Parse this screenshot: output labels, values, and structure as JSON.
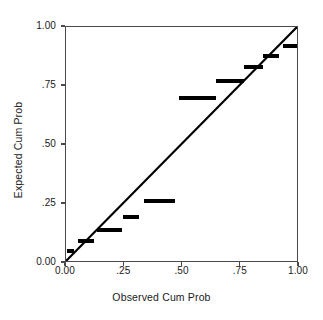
{
  "chart_data": {
    "type": "scatter",
    "title": "",
    "xlabel": "Observed Cum Prob",
    "ylabel": "Expected Cum Prob",
    "xlim": [
      0.0,
      1.0
    ],
    "ylim": [
      0.0,
      1.0
    ],
    "grid": false,
    "legend": null,
    "xticks": [
      0.0,
      0.25,
      0.5,
      0.75,
      1.0
    ],
    "yticks": [
      0.0,
      0.25,
      0.5,
      0.75,
      1.0
    ],
    "xticklabels": [
      "0.00",
      ".25",
      ".50",
      ".75",
      "1.00"
    ],
    "yticklabels": [
      "0.00",
      ".25",
      ".50",
      ".75",
      "1.00"
    ],
    "reference_line": {
      "description": "diagonal identity line",
      "x": [
        0.0,
        1.0
      ],
      "y": [
        0.0,
        1.0
      ],
      "color": "#000000"
    },
    "marker": {
      "shape": "square",
      "color": "#000000",
      "size_px": 4
    },
    "series": [
      {
        "name": "Normal P-P",
        "x": [
          0.011,
          0.026,
          0.06,
          0.073,
          0.086,
          0.099,
          0.112,
          0.142,
          0.155,
          0.168,
          0.181,
          0.194,
          0.207,
          0.22,
          0.233,
          0.253,
          0.266,
          0.279,
          0.292,
          0.305,
          0.343,
          0.356,
          0.369,
          0.382,
          0.395,
          0.408,
          0.421,
          0.434,
          0.447,
          0.46,
          0.492,
          0.505,
          0.518,
          0.531,
          0.544,
          0.557,
          0.57,
          0.583,
          0.596,
          0.609,
          0.622,
          0.635,
          0.652,
          0.665,
          0.678,
          0.691,
          0.704,
          0.717,
          0.73,
          0.743,
          0.756,
          0.772,
          0.785,
          0.798,
          0.811,
          0.824,
          0.837,
          0.852,
          0.865,
          0.878,
          0.891,
          0.904,
          0.938,
          0.951,
          0.964,
          0.977,
          0.99
        ],
        "y": [
          0.052,
          0.052,
          0.092,
          0.092,
          0.092,
          0.092,
          0.092,
          0.14,
          0.14,
          0.14,
          0.14,
          0.14,
          0.14,
          0.14,
          0.14,
          0.196,
          0.196,
          0.196,
          0.196,
          0.196,
          0.262,
          0.262,
          0.262,
          0.262,
          0.262,
          0.262,
          0.262,
          0.262,
          0.262,
          0.262,
          0.7,
          0.7,
          0.7,
          0.7,
          0.7,
          0.7,
          0.7,
          0.7,
          0.7,
          0.7,
          0.7,
          0.7,
          0.773,
          0.773,
          0.773,
          0.773,
          0.773,
          0.773,
          0.773,
          0.773,
          0.773,
          0.832,
          0.832,
          0.832,
          0.832,
          0.832,
          0.832,
          0.878,
          0.878,
          0.878,
          0.878,
          0.878,
          0.92,
          0.92,
          0.92,
          0.92,
          0.92
        ]
      }
    ]
  },
  "axes": {
    "x_title": "Observed Cum Prob",
    "y_title": "Expected Cum Prob"
  }
}
